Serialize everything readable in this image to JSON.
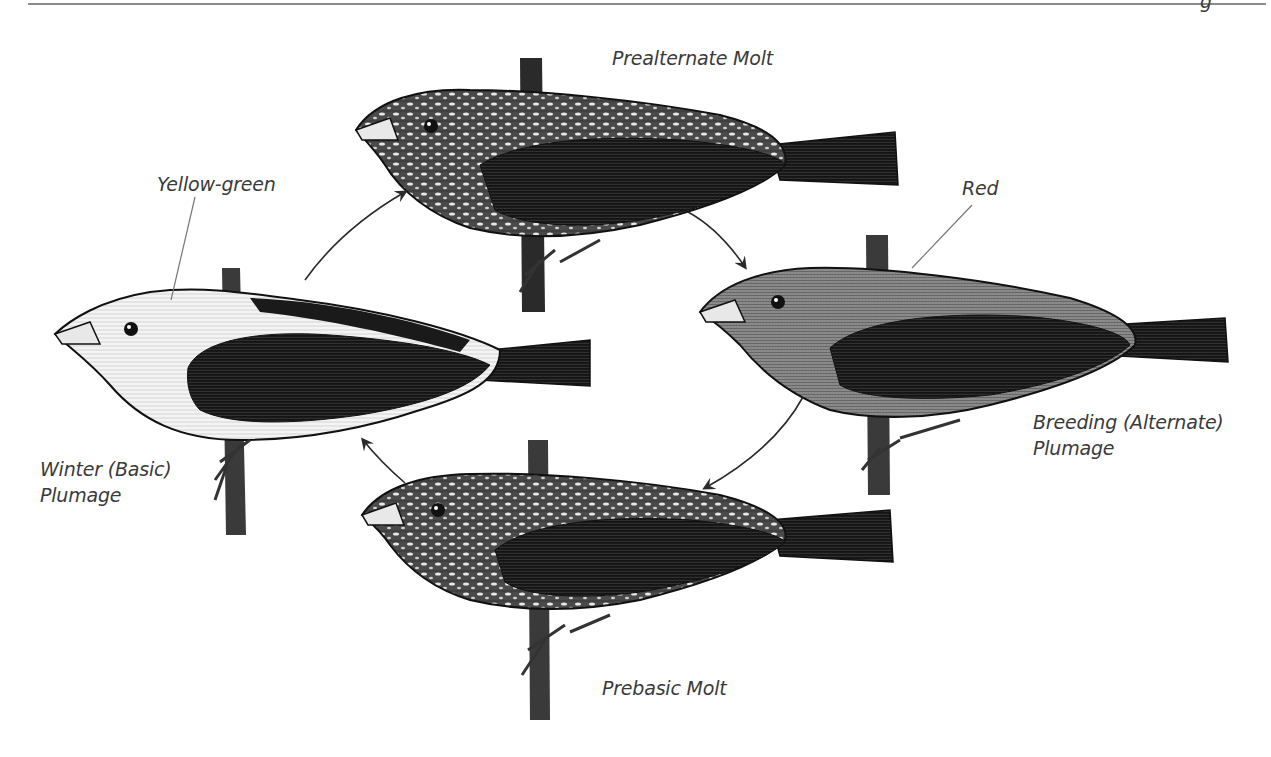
{
  "figure": {
    "header_partial_glyph": "g",
    "stages": [
      {
        "id": "winter",
        "label_line1": "Winter (Basic)",
        "label_line2": "Plumage",
        "color_callout": "Yellow-green"
      },
      {
        "id": "prealternate",
        "label_line1": "Prealternate Molt"
      },
      {
        "id": "breeding",
        "label_line1": "Breeding (Alternate)",
        "label_line2": "Plumage",
        "color_callout": "Red"
      },
      {
        "id": "prebasic",
        "label_line1": "Prebasic Molt"
      }
    ],
    "cycle_order": [
      "Winter (Basic) Plumage",
      "Prealternate Molt",
      "Breeding (Alternate) Plumage",
      "Prebasic Molt"
    ],
    "colors": {
      "ink": "#111111",
      "label": "#3a3a3a",
      "rule": "#8a8a8a",
      "light_body": "#f2f2f2",
      "mid_body": "#9a9a9a"
    }
  }
}
